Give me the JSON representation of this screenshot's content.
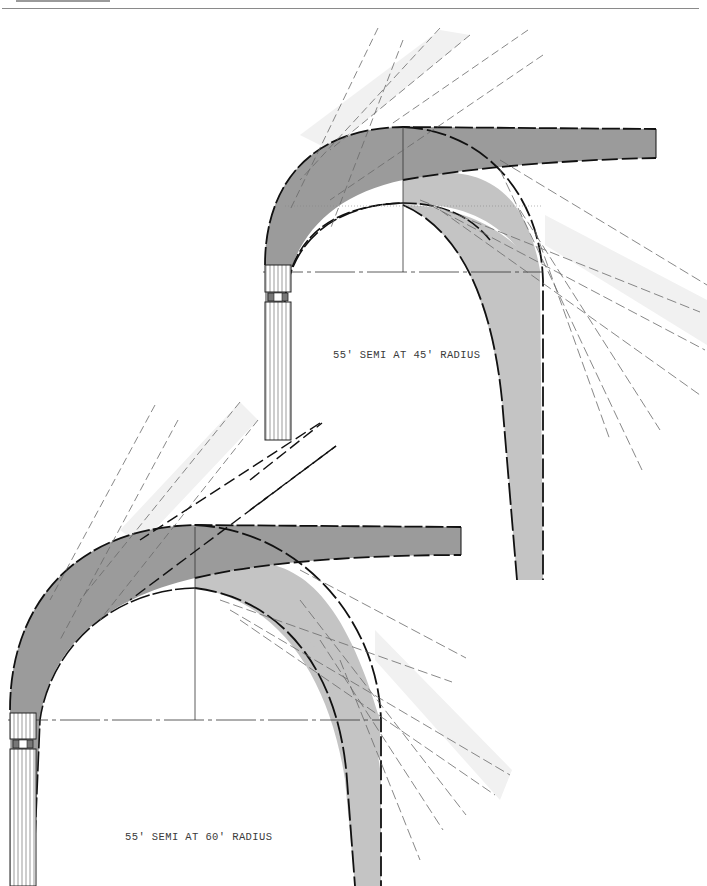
{
  "figures": [
    {
      "id": "top",
      "caption": "55′ SEMI AT 45′ RADIUS",
      "caption_x": 333,
      "caption_y": 358
    },
    {
      "id": "bottom",
      "caption": "55′ SEMI AT 60′ RADIUS",
      "caption_x": 125,
      "caption_y": 840
    }
  ],
  "colors": {
    "background": "#ffffff",
    "cab_sweep": "#9b9b9b",
    "trailer_sweep": "#c4c4c4",
    "projection_band": "#f1f1f1",
    "outline": "#111111",
    "guide_line": "#6a6a6a",
    "header_rule": "#8a8a8a"
  }
}
